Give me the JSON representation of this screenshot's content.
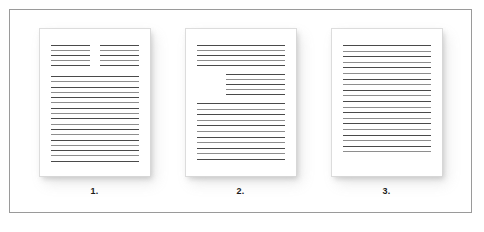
{
  "figure": {
    "background_color": "#ffffff",
    "border_color": "#9a9a9a",
    "line_color": "#4a4a4a",
    "page_background": "#ffffff",
    "caption_color": "#1a1a1a"
  },
  "documents": [
    {
      "caption": "1.",
      "layout": "two-column-header-then-body",
      "blocks": [
        {
          "kind": "two-column",
          "columns": [
            {
              "lines": 5
            },
            {
              "lines": 5
            }
          ]
        },
        {
          "kind": "full-width",
          "lines": 17
        }
      ]
    },
    {
      "caption": "2.",
      "layout": "header-indented-quote-then-body",
      "blocks": [
        {
          "kind": "full-width",
          "lines": 5
        },
        {
          "kind": "indented",
          "indent_percent": 33,
          "lines": 5
        },
        {
          "kind": "full-width",
          "lines": 11
        }
      ]
    },
    {
      "caption": "3.",
      "layout": "single-uniform-body",
      "blocks": [
        {
          "kind": "full-width",
          "lines": 20
        }
      ]
    }
  ]
}
